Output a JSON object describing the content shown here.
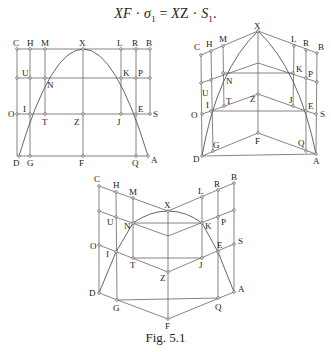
{
  "formula": {
    "lhs_a": "XF",
    "dot1": " · ",
    "sigma": "σ",
    "sigma_sub": "1",
    "eq": " = ",
    "rhs_a": "X",
    "rhs_b": "Z",
    "dot2": " · ",
    "S": "S",
    "S_sub": "1",
    "end": "."
  },
  "caption": "Fig. 5.1",
  "diagrams": {
    "flat": {
      "labels": {
        "C": "C",
        "H": "H",
        "M": "M",
        "X": "X",
        "L": "L",
        "R": "R",
        "B": "B",
        "U": "U",
        "N": "N",
        "K": "K",
        "P": "P",
        "O": "O",
        "I": "I",
        "T": "T",
        "Z": "Z",
        "J": "J",
        "E": "E",
        "S": "S",
        "D": "D",
        "G": "G",
        "F": "F",
        "Q": "Q",
        "A": "A"
      }
    },
    "folded_up": {
      "labels": {
        "C": "C",
        "H": "H",
        "M": "M",
        "X": "X",
        "L": "L",
        "R": "R",
        "B": "B",
        "U": "U",
        "N": "N",
        "K": "K",
        "P": "P",
        "O": "O",
        "I": "I",
        "T": "T",
        "Z": "Z",
        "J": "J",
        "E": "E",
        "S": "S",
        "D": "D",
        "G": "G",
        "F": "F",
        "Q": "Q",
        "A": "A"
      }
    },
    "folded_down": {
      "labels": {
        "C": "C",
        "H": "H",
        "M": "M",
        "X": "X",
        "L": "L",
        "R": "R",
        "B": "B",
        "U": "U",
        "N": "N",
        "K": "K",
        "P": "P",
        "O": "O",
        "I": "I",
        "T": "T",
        "Z": "Z",
        "J": "J",
        "E": "E",
        "S": "S",
        "D": "D",
        "G": "G",
        "F": "F",
        "Q": "Q",
        "A": "A"
      }
    }
  }
}
